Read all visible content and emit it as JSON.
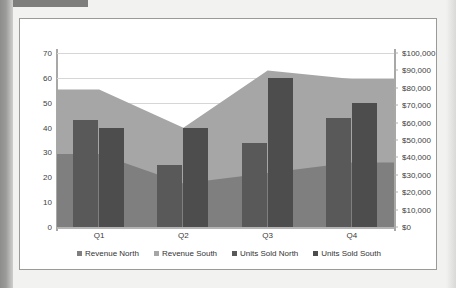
{
  "chart_data": {
    "type": "bar",
    "title": "",
    "subtitle": "",
    "xlabel": "",
    "ylabel": "",
    "categories": [
      "Q1",
      "Q2",
      "Q3",
      "Q4"
    ],
    "grid": true,
    "legend_position": "bottom",
    "axes": {
      "left": {
        "name": "Units Sold",
        "min": 0,
        "max": 70,
        "step": 10,
        "ticks": [
          "0",
          "10",
          "20",
          "30",
          "40",
          "50",
          "60",
          "70"
        ],
        "tick_values": [
          0,
          10,
          20,
          30,
          40,
          50,
          60,
          70
        ]
      },
      "right": {
        "name": "Revenue",
        "min": 0,
        "max": 100000,
        "step": 10000,
        "ticks": [
          "$0",
          "$10,000",
          "$20,000",
          "$30,000",
          "$40,000",
          "$50,000",
          "$60,000",
          "$70,000",
          "$80,000",
          "$90,000",
          "$100,000"
        ],
        "tick_values": [
          0,
          10000,
          20000,
          30000,
          40000,
          50000,
          60000,
          70000,
          80000,
          90000,
          100000
        ]
      }
    },
    "series": [
      {
        "name": "Revenue North",
        "kind": "area",
        "axis": "right",
        "color": "#7f7f7f",
        "values": [
          42000,
          25000,
          31000,
          37000
        ]
      },
      {
        "name": "Revenue South",
        "kind": "area",
        "axis": "right",
        "color": "#a6a6a6",
        "values": [
          79000,
          57000,
          90000,
          85000
        ]
      },
      {
        "name": "Units Sold North",
        "kind": "column",
        "axis": "left",
        "color": "#595959",
        "values": [
          43,
          25,
          34,
          44
        ]
      },
      {
        "name": "Units Sold South",
        "kind": "column",
        "axis": "left",
        "color": "#4d4d4d",
        "values": [
          40,
          40,
          60,
          50
        ]
      }
    ]
  },
  "legend": {
    "items": [
      {
        "label": "Revenue North",
        "color": "#7f7f7f"
      },
      {
        "label": "Revenue South",
        "color": "#a6a6a6"
      },
      {
        "label": "Units Sold North",
        "color": "#595959"
      },
      {
        "label": "Units Sold South",
        "color": "#4d4d4d"
      }
    ]
  },
  "colors": {
    "plot_background": "#ffffff",
    "page_background": "#f2f2f0",
    "frame_border": "#9a9a98",
    "gridline": "#d6d6d6",
    "tick_text": "#404040"
  }
}
